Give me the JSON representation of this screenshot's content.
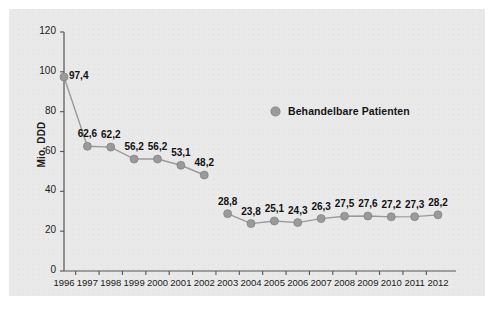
{
  "chart_data": {
    "type": "line",
    "title": "",
    "subtitle": "",
    "xlabel": "",
    "ylabel": "Mio. DDD",
    "categories": [
      "1996",
      "1997",
      "1998",
      "1999",
      "2000",
      "2001",
      "2002",
      "2003",
      "2004",
      "2005",
      "2006",
      "2007",
      "2008",
      "2009",
      "2010",
      "2011",
      "2012"
    ],
    "series": [
      {
        "name": "Behandelbare Patienten",
        "values": [
          97.4,
          62.6,
          62.2,
          56.2,
          56.2,
          53.1,
          48.2,
          28.8,
          23.8,
          25.1,
          24.3,
          26.3,
          27.5,
          27.6,
          27.2,
          27.3,
          28.2
        ],
        "labels": [
          "97,4",
          "62,6",
          "62,2",
          "56,2",
          "56,2",
          "53,1",
          "48,2",
          "28,8",
          "23,8",
          "25,1",
          "24,3",
          "26,3",
          "27,5",
          "27,6",
          "27,2",
          "27,3",
          "28,2"
        ],
        "color": "#9a9a9a",
        "marker": "circle",
        "break_after_index": 6
      }
    ],
    "ylim": [
      0,
      120
    ],
    "yticks": [
      0,
      20,
      40,
      60,
      80,
      100,
      120
    ],
    "ytick_labels": [
      "0",
      "20",
      "40",
      "60",
      "80",
      "100",
      "120"
    ],
    "grid": false,
    "legend": {
      "position": "top-right",
      "entries": [
        "Behandelbare Patienten"
      ]
    },
    "colors": {
      "panel_background": "#e9e9e9",
      "page_background": "#ffffff",
      "axis": "#555555",
      "series": "#9a9a9a",
      "text": "#1a1a1a"
    }
  }
}
